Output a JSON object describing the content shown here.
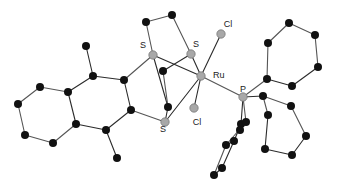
{
  "figure": {
    "width": 341,
    "height": 188,
    "background_color": "#ffffff"
  },
  "style": {
    "carbon_color": "#111111",
    "heteroatom_color": "#a8a8a8",
    "heteroatom_stroke": "#6e6e6e",
    "bond_color": "#555555",
    "bond_dark_color": "#2b2b2b",
    "label_color": "#1a1a1a",
    "carbon_radius": 4.0,
    "heteroatom_radius": 4.2,
    "bond_width": 1.1
  },
  "labels": [
    {
      "id": "lbl-s-upper-left",
      "text": "S",
      "x": 143,
      "y": 48,
      "anchor": "middle"
    },
    {
      "id": "lbl-s-upper-right",
      "text": "S",
      "x": 196,
      "y": 47,
      "anchor": "middle"
    },
    {
      "id": "lbl-s-lower",
      "text": "S",
      "x": 163,
      "y": 132,
      "anchor": "middle"
    },
    {
      "id": "lbl-ru",
      "text": "Ru",
      "x": 213,
      "y": 78,
      "anchor": "start"
    },
    {
      "id": "lbl-cl-upper",
      "text": "Cl",
      "x": 228,
      "y": 27,
      "anchor": "middle"
    },
    {
      "id": "lbl-cl-lower",
      "text": "Cl",
      "x": 197,
      "y": 125,
      "anchor": "middle"
    },
    {
      "id": "lbl-p",
      "text": "P",
      "x": 243,
      "y": 92,
      "anchor": "middle"
    }
  ],
  "atoms": [
    {
      "id": "C1",
      "element": "C",
      "x": 18,
      "y": 104,
      "kind": "carbon"
    },
    {
      "id": "C2",
      "element": "C",
      "x": 40,
      "y": 87,
      "kind": "carbon"
    },
    {
      "id": "C3",
      "element": "C",
      "x": 68,
      "y": 92,
      "kind": "carbon"
    },
    {
      "id": "C4",
      "element": "C",
      "x": 76,
      "y": 124,
      "kind": "carbon"
    },
    {
      "id": "C5",
      "element": "C",
      "x": 53,
      "y": 143,
      "kind": "carbon"
    },
    {
      "id": "C6",
      "element": "C",
      "x": 25,
      "y": 135,
      "kind": "carbon"
    },
    {
      "id": "C7",
      "element": "C",
      "x": 93,
      "y": 76,
      "kind": "carbon"
    },
    {
      "id": "C8",
      "element": "C",
      "x": 124,
      "y": 80,
      "kind": "carbon"
    },
    {
      "id": "C9",
      "element": "C",
      "x": 131,
      "y": 110,
      "kind": "carbon"
    },
    {
      "id": "C10",
      "element": "C",
      "x": 106,
      "y": 130,
      "kind": "carbon"
    },
    {
      "id": "C11",
      "element": "C",
      "x": 86,
      "y": 46,
      "kind": "carbon"
    },
    {
      "id": "C12",
      "element": "C",
      "x": 117,
      "y": 158,
      "kind": "carbon"
    },
    {
      "id": "S1",
      "element": "S",
      "x": 153,
      "y": 55,
      "kind": "hetero"
    },
    {
      "id": "S2",
      "element": "S",
      "x": 165,
      "y": 122,
      "kind": "hetero"
    },
    {
      "id": "C13",
      "element": "C",
      "x": 146,
      "y": 22,
      "kind": "carbon"
    },
    {
      "id": "C14",
      "element": "C",
      "x": 172,
      "y": 15,
      "kind": "carbon"
    },
    {
      "id": "S3",
      "element": "S",
      "x": 191,
      "y": 54,
      "kind": "hetero"
    },
    {
      "id": "C15",
      "element": "C",
      "x": 163,
      "y": 71,
      "kind": "carbon"
    },
    {
      "id": "C16",
      "element": "C",
      "x": 168,
      "y": 107,
      "kind": "carbon"
    },
    {
      "id": "RU",
      "element": "Ru",
      "x": 201,
      "y": 76,
      "kind": "hetero"
    },
    {
      "id": "CL1",
      "element": "Cl",
      "x": 221,
      "y": 34,
      "kind": "hetero"
    },
    {
      "id": "CL2",
      "element": "Cl",
      "x": 194,
      "y": 108,
      "kind": "hetero"
    },
    {
      "id": "P1",
      "element": "P",
      "x": 243,
      "y": 97,
      "kind": "hetero"
    },
    {
      "id": "C17",
      "element": "C",
      "x": 267,
      "y": 79,
      "kind": "carbon"
    },
    {
      "id": "C18",
      "element": "C",
      "x": 268,
      "y": 43,
      "kind": "carbon"
    },
    {
      "id": "C19",
      "element": "C",
      "x": 289,
      "y": 23,
      "kind": "carbon"
    },
    {
      "id": "C20",
      "element": "C",
      "x": 315,
      "y": 35,
      "kind": "carbon"
    },
    {
      "id": "C21",
      "element": "C",
      "x": 318,
      "y": 67,
      "kind": "carbon"
    },
    {
      "id": "C22",
      "element": "C",
      "x": 292,
      "y": 86,
      "kind": "carbon"
    },
    {
      "id": "C23",
      "element": "C",
      "x": 268,
      "y": 115,
      "kind": "carbon"
    },
    {
      "id": "C24",
      "element": "C",
      "x": 263,
      "y": 96,
      "kind": "carbon"
    },
    {
      "id": "C25",
      "element": "C",
      "x": 291,
      "y": 106,
      "kind": "carbon"
    },
    {
      "id": "C26",
      "element": "C",
      "x": 306,
      "y": 136,
      "kind": "carbon"
    },
    {
      "id": "C27",
      "element": "C",
      "x": 292,
      "y": 155,
      "kind": "carbon"
    },
    {
      "id": "C28",
      "element": "C",
      "x": 265,
      "y": 149,
      "kind": "carbon"
    },
    {
      "id": "C29",
      "element": "C",
      "x": 241,
      "y": 124,
      "kind": "carbon"
    },
    {
      "id": "C30",
      "element": "C",
      "x": 246,
      "y": 122,
      "kind": "carbon"
    },
    {
      "id": "C31",
      "element": "C",
      "x": 234,
      "y": 141,
      "kind": "carbon"
    },
    {
      "id": "C32",
      "element": "C",
      "x": 226,
      "y": 145,
      "kind": "carbon"
    },
    {
      "id": "C33",
      "element": "C",
      "x": 222,
      "y": 168,
      "kind": "carbon"
    },
    {
      "id": "C34",
      "element": "C",
      "x": 214,
      "y": 175,
      "kind": "carbon"
    },
    {
      "id": "C35",
      "element": "C",
      "x": 240,
      "y": 130,
      "kind": "carbon"
    }
  ],
  "bonds": [
    {
      "from": "C1",
      "to": "C2",
      "shade": "light"
    },
    {
      "from": "C2",
      "to": "C3",
      "shade": "light"
    },
    {
      "from": "C3",
      "to": "C4",
      "shade": "dark"
    },
    {
      "from": "C4",
      "to": "C5",
      "shade": "light"
    },
    {
      "from": "C5",
      "to": "C6",
      "shade": "light"
    },
    {
      "from": "C6",
      "to": "C1",
      "shade": "light"
    },
    {
      "from": "C3",
      "to": "C7",
      "shade": "dark"
    },
    {
      "from": "C7",
      "to": "C8",
      "shade": "dark"
    },
    {
      "from": "C8",
      "to": "C9",
      "shade": "dark"
    },
    {
      "from": "C9",
      "to": "C10",
      "shade": "dark"
    },
    {
      "from": "C10",
      "to": "C4",
      "shade": "dark"
    },
    {
      "from": "C7",
      "to": "C11",
      "shade": "dark"
    },
    {
      "from": "C10",
      "to": "C12",
      "shade": "dark"
    },
    {
      "from": "C8",
      "to": "S1",
      "shade": "light"
    },
    {
      "from": "C9",
      "to": "S2",
      "shade": "light"
    },
    {
      "from": "S1",
      "to": "C13",
      "shade": "light"
    },
    {
      "from": "C13",
      "to": "C14",
      "shade": "light"
    },
    {
      "from": "C14",
      "to": "S3",
      "shade": "light"
    },
    {
      "from": "S1",
      "to": "RU",
      "shade": "dark"
    },
    {
      "from": "S2",
      "to": "RU",
      "shade": "dark"
    },
    {
      "from": "S3",
      "to": "RU",
      "shade": "dark"
    },
    {
      "from": "S1",
      "to": "C16",
      "shade": "dark"
    },
    {
      "from": "S3",
      "to": "C15",
      "shade": "dark"
    },
    {
      "from": "C15",
      "to": "C16",
      "shade": "light"
    },
    {
      "from": "C16",
      "to": "S2",
      "shade": "dark"
    },
    {
      "from": "RU",
      "to": "CL1",
      "shade": "dark"
    },
    {
      "from": "RU",
      "to": "CL2",
      "shade": "dark"
    },
    {
      "from": "RU",
      "to": "P1",
      "shade": "light"
    },
    {
      "from": "P1",
      "to": "C17",
      "shade": "light"
    },
    {
      "from": "C17",
      "to": "C18",
      "shade": "light"
    },
    {
      "from": "C18",
      "to": "C19",
      "shade": "light"
    },
    {
      "from": "C19",
      "to": "C20",
      "shade": "light"
    },
    {
      "from": "C20",
      "to": "C21",
      "shade": "light"
    },
    {
      "from": "C21",
      "to": "C22",
      "shade": "dark"
    },
    {
      "from": "C22",
      "to": "C17",
      "shade": "dark"
    },
    {
      "from": "P1",
      "to": "C24",
      "shade": "dark"
    },
    {
      "from": "C24",
      "to": "C23",
      "shade": "light"
    },
    {
      "from": "C24",
      "to": "C25",
      "shade": "light"
    },
    {
      "from": "C25",
      "to": "C26",
      "shade": "light"
    },
    {
      "from": "C26",
      "to": "C27",
      "shade": "dark"
    },
    {
      "from": "C27",
      "to": "C28",
      "shade": "dark"
    },
    {
      "from": "C28",
      "to": "C23",
      "shade": "dark"
    },
    {
      "from": "P1",
      "to": "C29",
      "shade": "dark"
    },
    {
      "from": "P1",
      "to": "C30",
      "shade": "light"
    },
    {
      "from": "C29",
      "to": "C31",
      "shade": "dark"
    },
    {
      "from": "C30",
      "to": "C32",
      "shade": "light"
    },
    {
      "from": "C31",
      "to": "C33",
      "shade": "dark"
    },
    {
      "from": "C32",
      "to": "C34",
      "shade": "light"
    },
    {
      "from": "C33",
      "to": "C34",
      "shade": "dark"
    },
    {
      "from": "C29",
      "to": "C30",
      "shade": "dark"
    },
    {
      "from": "C31",
      "to": "C32",
      "shade": "dark"
    }
  ]
}
